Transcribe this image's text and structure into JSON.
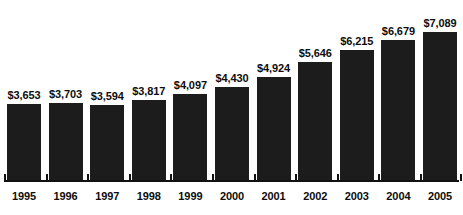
{
  "chart_data": {
    "type": "bar",
    "title": "",
    "subtitle": "",
    "xlabel": "",
    "ylabel": "",
    "categories": [
      "1995",
      "1996",
      "1997",
      "1998",
      "1999",
      "2000",
      "2001",
      "2002",
      "2003",
      "2004",
      "2005"
    ],
    "values": [
      3653,
      3703,
      3594,
      3817,
      4097,
      4430,
      4924,
      5646,
      6215,
      6679,
      7089
    ],
    "data_labels": [
      "$3,653",
      "$3,703",
      "$3,594",
      "$3,817",
      "$4,097",
      "$4,430",
      "$4,924",
      "$5,646",
      "$6,215",
      "$6,679",
      "$7,089"
    ],
    "ylim": [
      0,
      7600
    ],
    "grid": false,
    "legend": false,
    "legend_position": "none",
    "series": [
      {
        "name": "",
        "values": [
          3653,
          3703,
          3594,
          3817,
          4097,
          4430,
          4924,
          5646,
          6215,
          6679,
          7089
        ]
      }
    ],
    "colors": {
      "bar_fill": "#1c1c1c",
      "axis": "#111111",
      "label_text": "#0d0d0d",
      "background": "#ffffff"
    }
  },
  "axis": {
    "baseline_visible": true,
    "ticks_visible": true
  }
}
